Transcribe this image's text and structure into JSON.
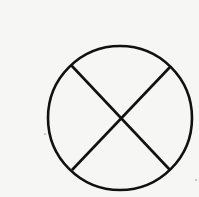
{
  "diagram": {
    "shape": "circle-with-x",
    "stroke_color": "#111111",
    "background_color": "#f6f6f5",
    "circle": {
      "cx": 120,
      "cy": 118,
      "r": 72
    },
    "lines": [
      {
        "x1": 71,
        "y1": 65,
        "x2": 170,
        "y2": 170
      },
      {
        "x1": 171,
        "y1": 66,
        "x2": 72,
        "y2": 170
      }
    ]
  }
}
